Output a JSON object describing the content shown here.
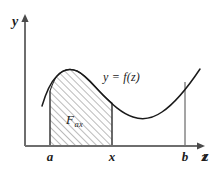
{
  "figure": {
    "kind": "integral-area-diagram",
    "background_color": "#ffffff",
    "line_color": "#1a1a1a",
    "axis_color": "#6e6e6e",
    "hatch_color": "#5d5d5d"
  },
  "axes": {
    "y_axis_label": "y",
    "x_axis_label": "z",
    "y_axis_x_px": 25,
    "x_axis_y_px": 146,
    "y_axis_top_px": 14,
    "x_axis_right_px": 205
  },
  "curve": {
    "label": "y = f(z)",
    "label_x_px": 103,
    "label_y_px": 71,
    "path": "M 42,106 C 45,96 49,84 56,77 C 63,69 70,68 77,71 C 86,75 94,86 103,95 C 112,104 121,113 133,117 C 142,120 152,119 162,112 C 174,104 188,87 200,69",
    "description": "Smooth curve rising from left to a local maximum, falling to a local minimum, then rising again toward b and beyond"
  },
  "shaded_region": {
    "label_main": "F",
    "label_sub": "ax",
    "label_x_px": 66,
    "label_y_px": 113,
    "left_bound": "a",
    "right_bound": "x",
    "hatch_spacing_px": 5,
    "hatch_angle_deg": 45,
    "path": "M 50,146 L 50,91 C 52,85 54,80 57,76 C 63,69 70,68 77,71 C 86,75 94,86 103,95 C 106,98 109,101 112,103 L 112,146 Z"
  },
  "ordinates": [
    {
      "name": "a",
      "x_px": 50,
      "top_y_px": 91,
      "bottom_y_px": 146
    },
    {
      "name": "x",
      "x_px": 112,
      "top_y_px": 103,
      "bottom_y_px": 146
    },
    {
      "name": "b",
      "x_px": 185,
      "top_y_px": 82,
      "bottom_y_px": 146
    }
  ],
  "tick_labels": [
    {
      "text": "a",
      "x_px": 50,
      "y_px": 150
    },
    {
      "text": "x",
      "x_px": 112,
      "y_px": 150
    },
    {
      "text": "b",
      "x_px": 185,
      "y_px": 150
    },
    {
      "text": "z",
      "x_px": 204,
      "y_px": 150
    }
  ]
}
